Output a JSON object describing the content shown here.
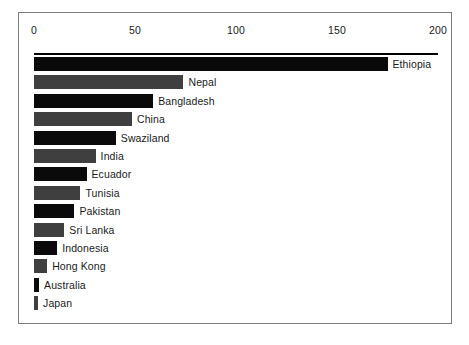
{
  "chart_data": {
    "type": "bar",
    "orientation": "horizontal",
    "title": "",
    "subtitle": "",
    "xlabel": "",
    "ylabel": "",
    "xlim": [
      0,
      200
    ],
    "ylim": null,
    "grid": false,
    "legend": null,
    "xticks": [
      0,
      50,
      100,
      150,
      200
    ],
    "xtick_labels": [
      "0",
      "50",
      "100",
      "150",
      "200"
    ],
    "categories": [
      "Ethiopia",
      "Nepal",
      "Bangladesh",
      "China",
      "Swaziland",
      "India",
      "Ecuador",
      "Tunisia",
      "Pakistan",
      "Sri Lanka",
      "Indonesia",
      "Hong Kong",
      "Australia",
      "Japan"
    ],
    "values": [
      175,
      74,
      59,
      48.5,
      40.5,
      30.5,
      26,
      23,
      20,
      15,
      11.5,
      6.5,
      2.5,
      2
    ],
    "bar_colors": [
      "#0a0a0a",
      "#3f3f3f",
      "#0a0a0a",
      "#3f3f3f",
      "#0a0a0a",
      "#3f3f3f",
      "#0a0a0a",
      "#3f3f3f",
      "#0a0a0a",
      "#3f3f3f",
      "#0a0a0a",
      "#3f3f3f",
      "#0a0a0a",
      "#3f3f3f"
    ],
    "colors": {
      "bar_dark": "#0a0a0a",
      "bar_gray": "#3f3f3f",
      "frame_border": "#7d7d7d",
      "axis_rule": "#000000",
      "background": "#ffffff",
      "text": "#1a1a1a"
    }
  }
}
